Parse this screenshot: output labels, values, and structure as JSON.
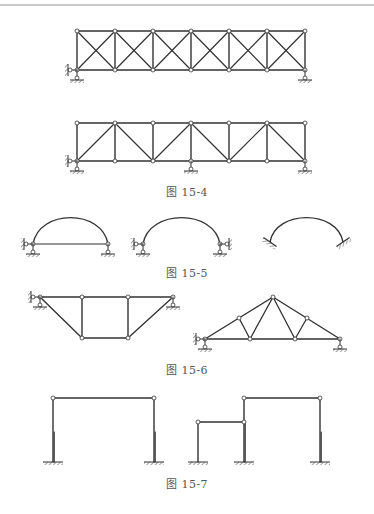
{
  "page": {
    "top_rule": true,
    "colors": {
      "line": "#333333",
      "node_fill": "#ffffff",
      "caption": "#555555",
      "rule": "#c8c8c8"
    }
  },
  "figures": [
    {
      "id": "fig-15-4",
      "caption": "图 15-4",
      "caption_pos": [
        187,
        183
      ],
      "items": [
        {
          "type": "truss",
          "label": "cross-braced truss",
          "panels": 6,
          "x0": 77,
          "dx": 38,
          "top_y": 31,
          "bottom_y": 70,
          "bracing": "x",
          "supports": [
            {
              "type": "pin-with-horizontal",
              "x": 77
            },
            {
              "type": "roller",
              "x": 305
            }
          ]
        },
        {
          "type": "truss",
          "label": "single-diagonal truss",
          "panels": 6,
          "x0": 77,
          "dx": 38,
          "top_y": 123,
          "bottom_y": 161,
          "bracing": "w",
          "supports": [
            {
              "type": "pin-with-horizontal",
              "x": 77
            },
            {
              "type": "roller",
              "x": 191
            },
            {
              "type": "roller",
              "x": 305
            }
          ]
        }
      ]
    },
    {
      "id": "fig-15-5",
      "caption": "图 15-5",
      "caption_pos": [
        187,
        264
      ],
      "items": [
        {
          "type": "tied-arch",
          "x1": 33,
          "x2": 108,
          "base_y": 244,
          "rise": 27
        },
        {
          "type": "two-hinged-arch",
          "x1": 143,
          "x2": 220,
          "base_y": 244,
          "rise": 27
        },
        {
          "type": "fixed-arch",
          "x1": 270,
          "x2": 343,
          "base_y": 246,
          "rise": 27
        }
      ]
    },
    {
      "id": "fig-15-6",
      "caption": "图 15-6",
      "caption_pos": [
        187,
        361
      ],
      "items": [
        {
          "type": "inverted-truss",
          "top_y": 297,
          "bottom_y": 338,
          "top_nodes": [
            40,
            82,
            128,
            173
          ],
          "bottom_nodes": [
            82,
            128
          ]
        },
        {
          "type": "roof-truss",
          "bottom_y": 339,
          "bottom_nodes": [
            205,
            250,
            295,
            340
          ],
          "apex": [
            273,
            297
          ],
          "mid_nodes": [
            [
              239,
              318
            ],
            [
              307,
              318
            ]
          ]
        }
      ]
    },
    {
      "id": "fig-15-7",
      "caption": "图 15-7",
      "caption_pos": [
        187,
        475
      ],
      "items": [
        {
          "type": "portal-frame",
          "x1": 53,
          "x2": 154,
          "top_y": 398,
          "base_y": 462
        },
        {
          "type": "stepped-frame",
          "x1": 244,
          "x2": 320,
          "top_y": 398,
          "low_x": 198,
          "low_y": 422,
          "base_y": 462
        }
      ]
    }
  ]
}
